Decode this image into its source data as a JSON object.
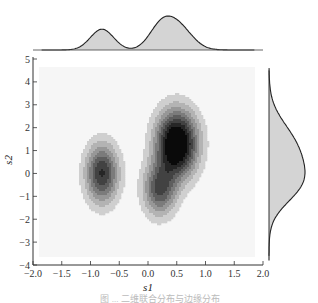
{
  "chart_data": {
    "type": "heatmap",
    "subtype": "2d-kde-joint-plot-with-marginals",
    "title": "",
    "xlabel": "s1",
    "ylabel": "s2",
    "xlim": [
      -2.0,
      2.0
    ],
    "ylim": [
      -4,
      5
    ],
    "x_ticks": [
      "-2.0",
      "-1.5",
      "-1.0",
      "-0.5",
      "0.0",
      "0.5",
      "1.0",
      "1.5",
      "2.0"
    ],
    "y_ticks": [
      "5",
      "4",
      "3",
      "2",
      "1",
      "0",
      "-1",
      "-2",
      "-3",
      "-4"
    ],
    "grid": false,
    "legend": null,
    "colormap": "greys",
    "density_components": [
      {
        "s1": -0.8,
        "s2": 0.0,
        "sd_s1": 0.2,
        "sd_s2": 0.9,
        "weight": 0.3
      },
      {
        "s1": 0.5,
        "s2": 1.3,
        "sd_s1": 0.25,
        "sd_s2": 1.0,
        "weight": 0.45
      },
      {
        "s1": 0.2,
        "s2": -0.7,
        "sd_s1": 0.2,
        "sd_s2": 0.8,
        "weight": 0.25
      }
    ],
    "contour_levels": 8,
    "marginal_top": {
      "variable": "s1",
      "peaks": [
        {
          "s1": -0.8,
          "relative_height": 0.45
        },
        {
          "s1": 0.45,
          "relative_height": 1.0
        }
      ],
      "fill": "#d4d4d4"
    },
    "marginal_right": {
      "variable": "s2",
      "peaks": [
        {
          "s2": 0.6,
          "relative_height": 1.0
        }
      ],
      "fill": "#d4d4d4"
    }
  },
  "caption": "图 ... 二维联合分布与边缘分布"
}
